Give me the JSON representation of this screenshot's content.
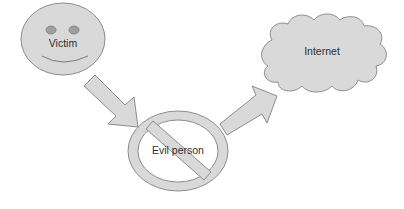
{
  "diagram": {
    "title": "",
    "nodes": [
      {
        "id": "victim",
        "label": "Victim",
        "shape": "smiley-face",
        "icon": "smiley-face-icon"
      },
      {
        "id": "evil",
        "label": "Evil person",
        "shape": "prohibition-sign",
        "icon": "prohibition-icon"
      },
      {
        "id": "internet",
        "label": "Internet",
        "shape": "cloud",
        "icon": "cloud-icon"
      }
    ],
    "edges": [
      {
        "from": "victim",
        "to": "evil",
        "style": "block-arrow"
      },
      {
        "from": "evil",
        "to": "internet",
        "style": "block-arrow"
      }
    ],
    "colors": {
      "fill": "#d9d9d9",
      "stroke": "#8c8c8c",
      "eye": "#9e9e9e",
      "text": "#2e2e2e",
      "background": "#ffffff"
    }
  }
}
